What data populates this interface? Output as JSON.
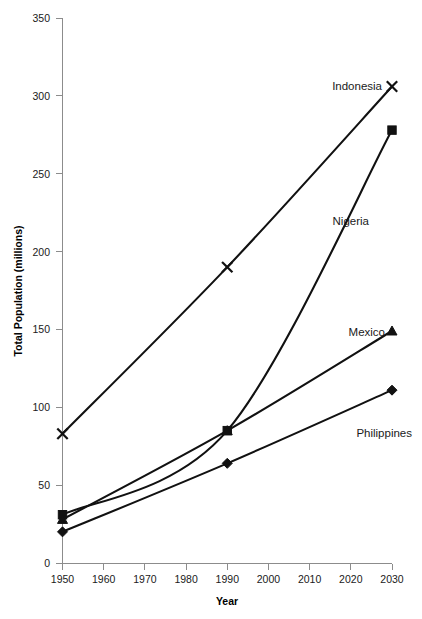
{
  "chart_data": {
    "type": "line",
    "title": "",
    "xlabel": "Year",
    "ylabel": "Total Population (millions)",
    "x": [
      1950,
      1990,
      2030
    ],
    "xlim": [
      1950,
      2030
    ],
    "ylim": [
      0,
      350
    ],
    "xticks": [
      "1950",
      "1960",
      "1970",
      "1980",
      "1990",
      "2000",
      "2010",
      "2020",
      "2030"
    ],
    "yticks": [
      "0",
      "50",
      "100",
      "150",
      "200",
      "250",
      "300",
      "350"
    ],
    "grid": false,
    "legend_position": "inline-end-of-line",
    "series": [
      {
        "name": "Indonesia",
        "marker": "x",
        "values": [
          83,
          190,
          306
        ],
        "label_text": "Indonesia"
      },
      {
        "name": "Nigeria",
        "marker": "square",
        "values": [
          31,
          85,
          278
        ],
        "label_text": "Nigeria"
      },
      {
        "name": "Mexico",
        "marker": "triangle",
        "values": [
          28,
          85,
          149
        ],
        "label_text": "Mexico"
      },
      {
        "name": "Philippines",
        "marker": "diamond",
        "values": [
          20,
          64,
          111
        ],
        "label_text": "Philippines"
      }
    ]
  },
  "axes": {
    "y_axis_title": "Total Population (millions)",
    "x_axis_title": "Year",
    "y_tick_labels": [
      "350",
      "300",
      "250",
      "200",
      "150",
      "100",
      "50",
      "0"
    ],
    "x_tick_labels": [
      "1950",
      "1960",
      "1970",
      "1980",
      "1990",
      "2000",
      "2010",
      "2020",
      "2030"
    ]
  },
  "annotations": {
    "indonesia": "Indonesia",
    "nigeria": "Nigeria",
    "mexico": "Mexico",
    "philippines": "Philippines"
  },
  "colors": {
    "series_stroke": "#111111",
    "axis": "#8c8c8c",
    "text": "#1a1a1a",
    "background": "#ffffff"
  }
}
